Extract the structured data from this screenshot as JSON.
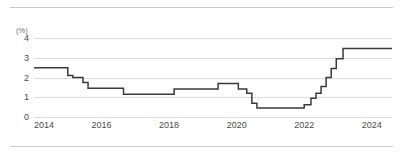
{
  "chart_data": {
    "type": "line",
    "line_style": "step",
    "title": "",
    "subtitle": "",
    "xlabel": "",
    "ylabel": "",
    "unit_label": "(%)",
    "xlim": [
      2014.0,
      2024.6
    ],
    "ylim": [
      0,
      4
    ],
    "yticks": [
      0,
      1,
      2,
      3,
      4
    ],
    "ytick_labels": [
      "0",
      "1",
      "2",
      "3",
      "4"
    ],
    "xticks": [
      2014,
      2016,
      2018,
      2020,
      2022,
      2024
    ],
    "xtick_labels": [
      "2014",
      "2016",
      "2018",
      "2020",
      "2022",
      "2024"
    ],
    "grid": true,
    "grid_axis": "y",
    "legend": false,
    "legend_position": "none",
    "series": [
      {
        "name": "policy rate",
        "color": "#3a3a3a",
        "x": [
          2014.0,
          2014.85,
          2015.0,
          2015.15,
          2015.45,
          2015.6,
          2016.65,
          2017.95,
          2018.15,
          2018.95,
          2019.45,
          2019.7,
          2020.05,
          2020.3,
          2020.45,
          2020.6,
          2021.85,
          2022.0,
          2022.2,
          2022.35,
          2022.5,
          2022.65,
          2022.8,
          2022.95,
          2023.15,
          2024.6
        ],
        "y": [
          2.5,
          2.5,
          2.1,
          2.0,
          1.75,
          1.45,
          1.15,
          1.15,
          1.42,
          1.42,
          1.7,
          1.7,
          1.42,
          1.2,
          0.7,
          0.45,
          0.45,
          0.62,
          0.95,
          1.2,
          1.55,
          2.0,
          2.45,
          2.95,
          3.47,
          3.47
        ]
      }
    ],
    "annotations": []
  },
  "style": {
    "background": "#ffffff",
    "grid_color": "#dcdcdc",
    "rule_color": "#c9c9c9",
    "tick_text_color": "#4a4a4a",
    "unit_text_color": "#6a6a6a",
    "series_color": "#3a3a3a"
  }
}
